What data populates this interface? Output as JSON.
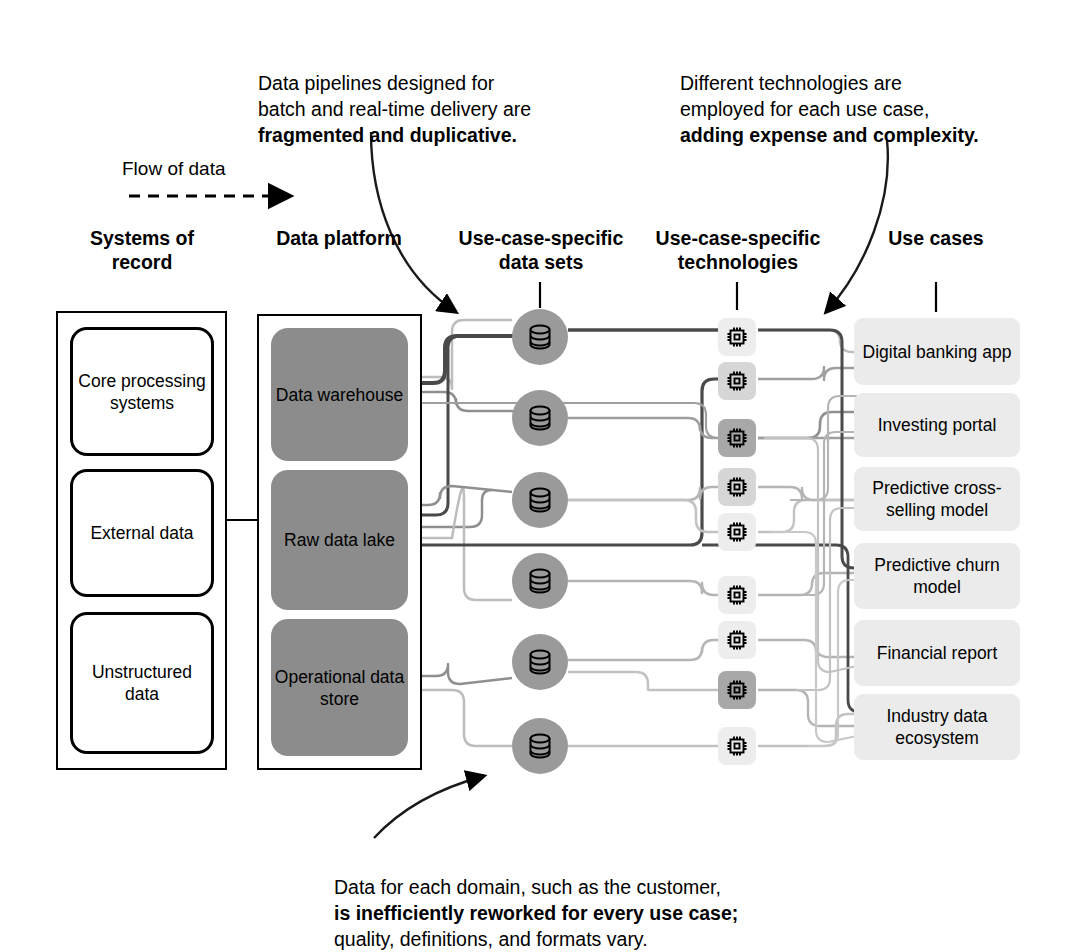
{
  "flow_legend": {
    "label": "Flow of data",
    "icon": "dashed-arrow-icon"
  },
  "callouts": [
    {
      "id": "pipelines",
      "plain": "Data pipelines designed for\nbatch and real-time delivery are\n",
      "bold": "fragmented and duplicative.",
      "arrow": "curved-arrow-icon"
    },
    {
      "id": "technologies",
      "plain": "Different technologies are\nemployed for each use case,\n",
      "bold": "adding expense and complexity.",
      "arrow": "curved-arrow-icon"
    },
    {
      "id": "domains",
      "plain_before": "Data for each domain, such as the customer,\n",
      "bold": "is inefficiently reworked for every use case;",
      "plain_after": "\nquality, definitions, and formats vary.",
      "arrow": "curved-arrow-icon"
    }
  ],
  "columns": [
    {
      "id": "systems-of-record",
      "heading": "Systems\nof record"
    },
    {
      "id": "data-platform",
      "heading": "Data\nplatform"
    },
    {
      "id": "data-sets",
      "heading": "Use-case-specific\ndata sets"
    },
    {
      "id": "technologies",
      "heading": "Use-case-specific\ntechnologies"
    },
    {
      "id": "use-cases",
      "heading": "Use\ncases"
    }
  ],
  "systems_of_record": [
    {
      "label": "Core\nprocessing\nsystems"
    },
    {
      "label": "External\ndata"
    },
    {
      "label": "Unstructured\ndata"
    }
  ],
  "data_platform": [
    {
      "label": "Data\nwarehouse"
    },
    {
      "label": "Raw data\nlake"
    },
    {
      "label": "Operational\ndata store"
    }
  ],
  "data_sets": [
    {
      "icon": "database-icon"
    },
    {
      "icon": "database-icon"
    },
    {
      "icon": "database-icon"
    },
    {
      "icon": "database-icon"
    },
    {
      "icon": "database-icon"
    },
    {
      "icon": "database-icon"
    }
  ],
  "technologies": [
    {
      "icon": "chip-icon",
      "shade": "light"
    },
    {
      "icon": "chip-icon",
      "shade": "mid"
    },
    {
      "icon": "chip-icon",
      "shade": "dark"
    },
    {
      "icon": "chip-icon",
      "shade": "mid"
    },
    {
      "icon": "chip-icon",
      "shade": "light"
    },
    {
      "icon": "chip-icon",
      "shade": "light"
    },
    {
      "icon": "chip-icon",
      "shade": "light"
    },
    {
      "icon": "chip-icon",
      "shade": "dark"
    },
    {
      "icon": "chip-icon",
      "shade": "light"
    }
  ],
  "use_cases": [
    {
      "label": "Digital banking\napp"
    },
    {
      "label": "Investing portal"
    },
    {
      "label": "Predictive\ncross-selling model"
    },
    {
      "label": "Predictive\nchurn model"
    },
    {
      "label": "Financial\nreport"
    },
    {
      "label": "Industry data\necosystem"
    }
  ],
  "colors": {
    "platform_fill": "#8c8c8c",
    "dataset_fill": "#9a9a9a",
    "usecase_fill": "#ebebeb",
    "chip_light": "#ededed",
    "chip_mid": "#d6d6d6",
    "chip_dark": "#a8a8a8",
    "wire_dark": "#4a4a4a",
    "wire_mid": "#8f8f8f",
    "wire_light": "#bdbdbd",
    "outline": "#000000"
  }
}
